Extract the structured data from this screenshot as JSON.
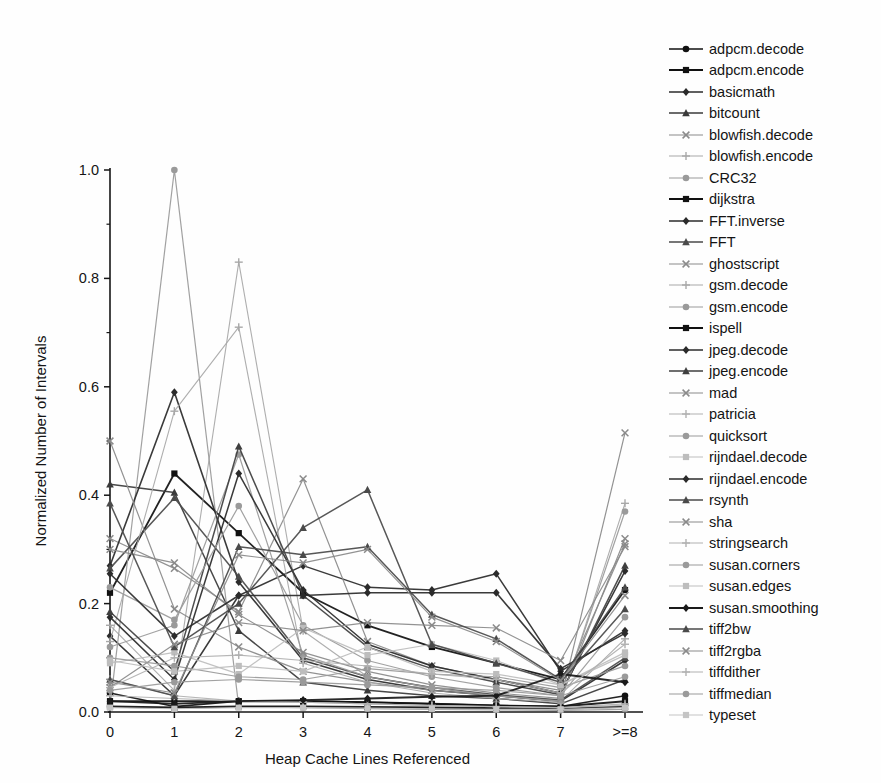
{
  "chart_data": {
    "type": "line",
    "title": "",
    "subtitle": "",
    "xlabel": "Heap Cache Lines Referenced",
    "ylabel": "Normalized Number of Intervals",
    "categories": [
      "0",
      "1",
      "2",
      "3",
      "4",
      "5",
      "6",
      "7",
      ">=8"
    ],
    "x_tick_labels": [
      "0",
      "1",
      "2",
      "3",
      "4",
      "5",
      "6",
      "7",
      ">=8"
    ],
    "y_tick_labels": [
      "0.0",
      "0.2",
      "0.4",
      "0.6",
      "0.8",
      "1.0"
    ],
    "y_ticks": [
      0.0,
      0.2,
      0.4,
      0.6,
      0.8,
      1.0
    ],
    "y_minor_ticks": [
      0.1,
      0.3,
      0.5,
      0.7,
      0.9
    ],
    "ylim": [
      0.0,
      1.0
    ],
    "grid": false,
    "legend_position": "right",
    "axis_style": "left-and-bottom-spines",
    "series": [
      {
        "name": "adpcm.decode",
        "marker": "circle",
        "color": "#111111",
        "width": 1.6,
        "values": [
          0.035,
          0.01,
          0.02,
          0.02,
          0.018,
          0.015,
          0.012,
          0.01,
          0.03
        ]
      },
      {
        "name": "adpcm.encode",
        "marker": "square",
        "color": "#111111",
        "width": 1.8,
        "values": [
          0.22,
          0.44,
          0.33,
          0.22,
          0.16,
          0.12,
          0.09,
          0.06,
          0.225
        ]
      },
      {
        "name": "basicmath",
        "marker": "diamond",
        "color": "#2b2b2b",
        "width": 1.5,
        "values": [
          0.14,
          0.03,
          0.215,
          0.27,
          0.23,
          0.225,
          0.255,
          0.075,
          0.15
        ]
      },
      {
        "name": "bitcount",
        "marker": "triangle",
        "color": "#3a3a3a",
        "width": 1.5,
        "values": [
          0.42,
          0.405,
          0.15,
          0.055,
          0.04,
          0.03,
          0.025,
          0.015,
          0.06
        ]
      },
      {
        "name": "blowfish.decode",
        "marker": "x",
        "color": "#8a8a8a",
        "width": 1.2,
        "values": [
          0.32,
          0.265,
          0.185,
          0.43,
          0.13,
          0.085,
          0.06,
          0.04,
          0.31
        ]
      },
      {
        "name": "blowfish.encode",
        "marker": "plus",
        "color": "#a8a8a8",
        "width": 1.1,
        "values": [
          0.16,
          0.04,
          0.83,
          0.15,
          0.065,
          0.045,
          0.03,
          0.02,
          0.135
        ]
      },
      {
        "name": "CRC32",
        "marker": "circle",
        "color": "#9a9a9a",
        "width": 1.2,
        "values": [
          0.01,
          1.0,
          0.01,
          0.008,
          0.006,
          0.005,
          0.004,
          0.003,
          0.005
        ]
      },
      {
        "name": "dijkstra",
        "marker": "square",
        "color": "#111111",
        "width": 2.0,
        "values": [
          0.02,
          0.02,
          0.02,
          0.02,
          0.018,
          0.015,
          0.012,
          0.01,
          0.02
        ]
      },
      {
        "name": "FFT.inverse",
        "marker": "diamond",
        "color": "#2b2b2b",
        "width": 1.6,
        "values": [
          0.27,
          0.59,
          0.24,
          0.095,
          0.06,
          0.04,
          0.03,
          0.02,
          0.095
        ]
      },
      {
        "name": "FFT",
        "marker": "triangle",
        "color": "#4a4a4a",
        "width": 1.5,
        "values": [
          0.265,
          0.395,
          0.25,
          0.1,
          0.065,
          0.045,
          0.032,
          0.022,
          0.1
        ]
      },
      {
        "name": "ghostscript",
        "marker": "x",
        "color": "#8a8a8a",
        "width": 1.2,
        "values": [
          0.5,
          0.19,
          0.12,
          0.075,
          0.055,
          0.04,
          0.03,
          0.02,
          0.515
        ]
      },
      {
        "name": "gsm.decode",
        "marker": "plus",
        "color": "#a8a8a8",
        "width": 1.1,
        "values": [
          0.13,
          0.555,
          0.71,
          0.09,
          0.055,
          0.035,
          0.025,
          0.018,
          0.385
        ]
      },
      {
        "name": "gsm.encode",
        "marker": "circle",
        "color": "#9a9a9a",
        "width": 1.2,
        "values": [
          0.12,
          0.16,
          0.475,
          0.105,
          0.065,
          0.045,
          0.03,
          0.02,
          0.37
        ]
      },
      {
        "name": "ispell",
        "marker": "square",
        "color": "#111111",
        "width": 2.2,
        "values": [
          0.01,
          0.008,
          0.01,
          0.01,
          0.009,
          0.008,
          0.007,
          0.006,
          0.01
        ]
      },
      {
        "name": "jpeg.decode",
        "marker": "diamond",
        "color": "#2b2b2b",
        "width": 1.5,
        "values": [
          0.175,
          0.06,
          0.44,
          0.225,
          0.125,
          0.085,
          0.06,
          0.035,
          0.26
        ]
      },
      {
        "name": "jpeg.encode",
        "marker": "triangle",
        "color": "#3f3f3f",
        "width": 1.5,
        "values": [
          0.185,
          0.075,
          0.49,
          0.215,
          0.12,
          0.08,
          0.055,
          0.032,
          0.27
        ]
      },
      {
        "name": "mad",
        "marker": "x",
        "color": "#8a8a8a",
        "width": 1.2,
        "values": [
          0.3,
          0.275,
          0.18,
          0.11,
          0.075,
          0.05,
          0.035,
          0.025,
          0.32
        ]
      },
      {
        "name": "patricia",
        "marker": "plus",
        "color": "#b0b0b0",
        "width": 1.1,
        "values": [
          0.06,
          0.03,
          0.02,
          0.018,
          0.015,
          0.012,
          0.01,
          0.008,
          0.015
        ]
      },
      {
        "name": "quicksort",
        "marker": "circle",
        "color": "#9a9a9a",
        "width": 1.2,
        "values": [
          0.23,
          0.17,
          0.38,
          0.16,
          0.095,
          0.065,
          0.045,
          0.03,
          0.175
        ]
      },
      {
        "name": "rijndael.decode",
        "marker": "square",
        "color": "#bdbdbd",
        "width": 1.2,
        "values": [
          0.09,
          0.11,
          0.07,
          0.155,
          0.105,
          0.125,
          0.095,
          0.05,
          0.105
        ]
      },
      {
        "name": "rijndael.encode",
        "marker": "diamond",
        "color": "#2b2b2b",
        "width": 1.6,
        "values": [
          0.255,
          0.14,
          0.215,
          0.215,
          0.22,
          0.22,
          0.22,
          0.08,
          0.145
        ]
      },
      {
        "name": "rsynth",
        "marker": "triangle",
        "color": "#4a4a4a",
        "width": 1.5,
        "values": [
          0.385,
          0.12,
          0.2,
          0.34,
          0.41,
          0.125,
          0.09,
          0.055,
          0.19
        ]
      },
      {
        "name": "sha",
        "marker": "x",
        "color": "#8a8a8a",
        "width": 1.2,
        "values": [
          0.045,
          0.125,
          0.165,
          0.15,
          0.165,
          0.16,
          0.155,
          0.095,
          0.305
        ]
      },
      {
        "name": "stringsearch",
        "marker": "plus",
        "color": "#b0b0b0",
        "width": 1.1,
        "values": [
          0.03,
          0.025,
          0.02,
          0.018,
          0.015,
          0.012,
          0.01,
          0.008,
          0.012
        ]
      },
      {
        "name": "susan.corners",
        "marker": "circle",
        "color": "#9a9a9a",
        "width": 1.2,
        "values": [
          0.1,
          0.085,
          0.065,
          0.06,
          0.08,
          0.07,
          0.065,
          0.045,
          0.085
        ]
      },
      {
        "name": "susan.edges",
        "marker": "square",
        "color": "#bdbdbd",
        "width": 1.2,
        "values": [
          0.095,
          0.075,
          0.085,
          0.075,
          0.12,
          0.075,
          0.07,
          0.05,
          0.11
        ]
      },
      {
        "name": "susan.smoothing",
        "marker": "diamond",
        "color": "#1a1a1a",
        "width": 1.9,
        "values": [
          0.02,
          0.015,
          0.02,
          0.022,
          0.025,
          0.028,
          0.03,
          0.07,
          0.055
        ]
      },
      {
        "name": "tiff2bw",
        "marker": "triangle",
        "color": "#4a4a4a",
        "width": 1.5,
        "values": [
          0.06,
          0.03,
          0.305,
          0.29,
          0.305,
          0.18,
          0.135,
          0.06,
          0.23
        ]
      },
      {
        "name": "tiff2rgba",
        "marker": "x",
        "color": "#8a8a8a",
        "width": 1.2,
        "values": [
          0.055,
          0.035,
          0.29,
          0.275,
          0.3,
          0.175,
          0.13,
          0.058,
          0.215
        ]
      },
      {
        "name": "tiffdither",
        "marker": "plus",
        "color": "#b0b0b0",
        "width": 1.1,
        "values": [
          0.045,
          0.1,
          0.105,
          0.095,
          0.085,
          0.07,
          0.06,
          0.035,
          0.125
        ]
      },
      {
        "name": "tiffmedian",
        "marker": "circle",
        "color": "#9a9a9a",
        "width": 1.2,
        "values": [
          0.04,
          0.055,
          0.06,
          0.055,
          0.05,
          0.045,
          0.04,
          0.03,
          0.065
        ]
      },
      {
        "name": "typeset",
        "marker": "square",
        "color": "#c4c4c4",
        "width": 1.2,
        "values": [
          0.008,
          0.006,
          0.008,
          0.008,
          0.007,
          0.006,
          0.005,
          0.005,
          0.008
        ]
      }
    ]
  },
  "legend": {
    "items": [
      {
        "label": "adpcm.decode"
      },
      {
        "label": "adpcm.encode"
      },
      {
        "label": "basicmath"
      },
      {
        "label": "bitcount"
      },
      {
        "label": "blowfish.decode"
      },
      {
        "label": "blowfish.encode"
      },
      {
        "label": "CRC32"
      },
      {
        "label": "dijkstra"
      },
      {
        "label": "FFT.inverse"
      },
      {
        "label": "FFT"
      },
      {
        "label": "ghostscript"
      },
      {
        "label": "gsm.decode"
      },
      {
        "label": "gsm.encode"
      },
      {
        "label": "ispell"
      },
      {
        "label": "jpeg.decode"
      },
      {
        "label": "jpeg.encode"
      },
      {
        "label": "mad"
      },
      {
        "label": "patricia"
      },
      {
        "label": "quicksort"
      },
      {
        "label": "rijndael.decode"
      },
      {
        "label": "rijndael.encode"
      },
      {
        "label": "rsynth"
      },
      {
        "label": "sha"
      },
      {
        "label": "stringsearch"
      },
      {
        "label": "susan.corners"
      },
      {
        "label": "susan.edges"
      },
      {
        "label": "susan.smoothing"
      },
      {
        "label": "tiff2bw"
      },
      {
        "label": "tiff2rgba"
      },
      {
        "label": "tiffdither"
      },
      {
        "label": "tiffmedian"
      },
      {
        "label": "typeset"
      }
    ]
  }
}
